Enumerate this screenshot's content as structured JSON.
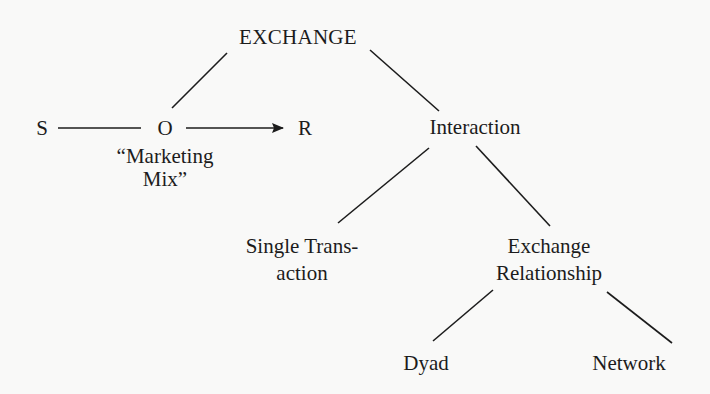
{
  "diagram": {
    "nodes": {
      "exchange": "EXCHANGE",
      "s": "S",
      "o": "O",
      "r": "R",
      "marketing_mix_line1": "“Marketing",
      "marketing_mix_line2": "Mix”",
      "interaction": "Interaction",
      "single_transaction_line1": "Single Trans-",
      "single_transaction_line2": "action",
      "exchange_relationship_line1": "Exchange",
      "exchange_relationship_line2": "Relationship",
      "dyad": "Dyad",
      "network": "Network"
    },
    "edges": [
      {
        "from": "EXCHANGE",
        "to": "O"
      },
      {
        "from": "EXCHANGE",
        "to": "Interaction"
      },
      {
        "from": "S",
        "to": "O"
      },
      {
        "from": "O",
        "to": "R",
        "arrow": true
      },
      {
        "from": "Interaction",
        "to": "Single Transaction"
      },
      {
        "from": "Interaction",
        "to": "Exchange Relationship"
      },
      {
        "from": "Exchange Relationship",
        "to": "Dyad"
      },
      {
        "from": "Exchange Relationship",
        "to": "Network"
      }
    ],
    "colors": {
      "background": "#f9f9f8",
      "ink": "#1c1c1c"
    }
  }
}
